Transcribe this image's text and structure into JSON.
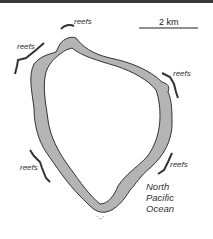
{
  "map": {
    "scale_label": "2 km",
    "reef_labels": [
      "reefs",
      "reefs",
      "reefs",
      "reefs",
      "reefs"
    ],
    "ocean_label": [
      "North",
      "Pacific",
      "Ocean"
    ],
    "colors": {
      "island": "#b4b4b4",
      "outline": "#333333",
      "reef": "#333333",
      "background": "#ffffff"
    }
  }
}
